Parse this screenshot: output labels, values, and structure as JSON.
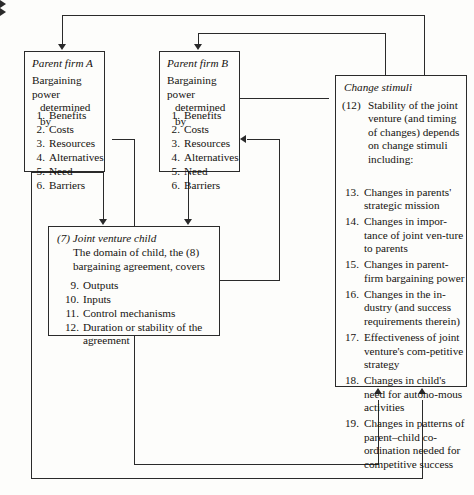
{
  "diagram": {
    "line_color": "#2a2a2a",
    "background": "#fdfdfb"
  },
  "parent_a": {
    "title": "Parent firm A",
    "header_line1": "Bargaining power",
    "header_line2": "determined by",
    "items": [
      {
        "n": "1.",
        "t": "Benefits"
      },
      {
        "n": "2.",
        "t": "Costs"
      },
      {
        "n": "3.",
        "t": "Resources"
      },
      {
        "n": "4.",
        "t": "Alternatives"
      },
      {
        "n": "5.",
        "t": "Need"
      },
      {
        "n": "6.",
        "t": "Barriers"
      }
    ]
  },
  "parent_b": {
    "title": "Parent firm B",
    "header_line1": "Bargaining power",
    "header_line2": "determined by",
    "items": [
      {
        "n": "1.",
        "t": "Benefits"
      },
      {
        "n": "2.",
        "t": "Costs"
      },
      {
        "n": "3.",
        "t": "Resources"
      },
      {
        "n": "4.",
        "t": "Alternatives"
      },
      {
        "n": "5.",
        "t": "Need"
      },
      {
        "n": "6.",
        "t": "Barriers"
      }
    ]
  },
  "joint_venture_child": {
    "marker": "(7)",
    "title": "Joint venture child",
    "description": "The domain of child, the (8) bargaining agreement, covers",
    "items": [
      {
        "n": "9.",
        "t": "Outputs"
      },
      {
        "n": "10.",
        "t": "Inputs"
      },
      {
        "n": "11.",
        "t": "Control mechanisms"
      },
      {
        "n": "12.",
        "t": "Duration or stability of the agreement"
      }
    ]
  },
  "change_stimuli": {
    "title": "Change stimuli",
    "lead_marker": "(12)",
    "lead_text": "Stability of the joint venture (and timing of changes) depends on change stimuli including:",
    "items": [
      {
        "n": "13.",
        "t": "Changes in parents' strategic mission"
      },
      {
        "n": "14.",
        "t": "Changes in impor-tance of joint ven-ture to parents"
      },
      {
        "n": "15.",
        "t": "Changes in parent-firm bargaining power"
      },
      {
        "n": "16.",
        "t": "Changes in the in-dustry (and success requirements therein)"
      },
      {
        "n": "17.",
        "t": "Effectiveness of joint venture's com-petitive strategy"
      },
      {
        "n": "18.",
        "t": "Changes in child's need for autono-mous activities"
      },
      {
        "n": "19.",
        "t": "Changes in patterns of parent–child co-ordination needed for competitive success"
      }
    ]
  }
}
